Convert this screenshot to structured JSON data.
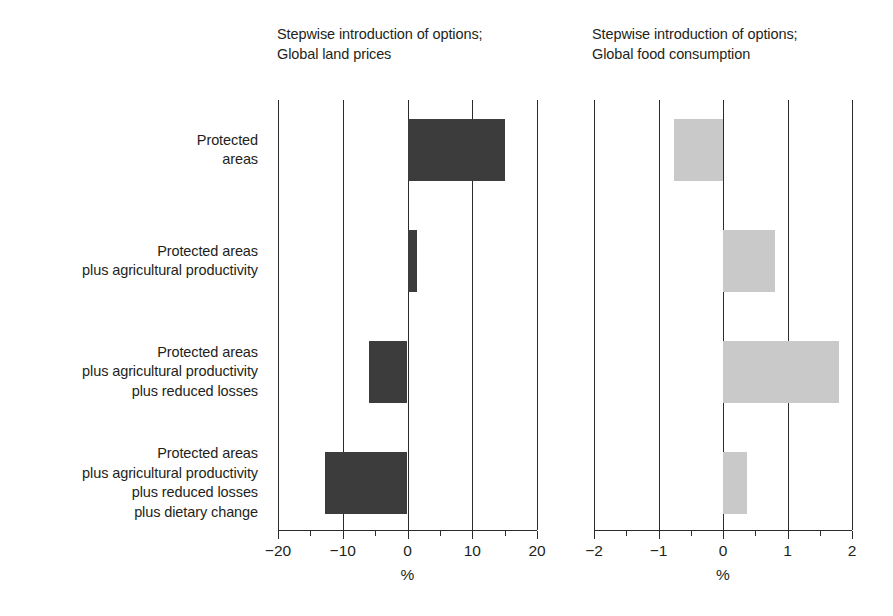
{
  "chart_data": [
    {
      "type": "bar",
      "orientation": "horizontal",
      "title": "Stepwise introduction of options;\nGlobal land prices",
      "title_line1": "Stepwise introduction of options;",
      "title_line2": "Global land prices",
      "xlabel": "%",
      "ylabel": "",
      "xlim": [
        -20,
        20
      ],
      "xticks": [
        -20,
        -10,
        0,
        10,
        20
      ],
      "xtick_labels": [
        "−20",
        "−10",
        "0",
        "10",
        "20"
      ],
      "minor_tick_step": 5,
      "grid": "vertical gridlines at every major tick",
      "legend": "none",
      "bar_color": "#3c3c3c",
      "categories": [
        "Protected\nareas",
        "Protected areas\nplus agricultural productivity",
        "Protected areas\nplus agricultural productivity\nplus reduced losses",
        "Protected areas\nplus agricultural productivity\nplus reduced losses\nplus dietary change"
      ],
      "values": [
        15.0,
        1.5,
        -6.0,
        -12.8
      ]
    },
    {
      "type": "bar",
      "orientation": "horizontal",
      "title": "Stepwise introduction of options;\nGlobal food consumption",
      "title_line1": "Stepwise introduction of options;",
      "title_line2": "Global food consumption",
      "xlabel": "%",
      "ylabel": "",
      "xlim": [
        -2,
        2
      ],
      "xticks": [
        -2,
        -1,
        0,
        1,
        2
      ],
      "xtick_labels": [
        "−2",
        "−1",
        "0",
        "1",
        "2"
      ],
      "minor_tick_step": 0.5,
      "grid": "vertical gridlines at every major tick",
      "legend": "none",
      "bar_color": "#c9c9c9",
      "categories": [
        "Protected\nareas",
        "Protected areas\nplus agricultural productivity",
        "Protected areas\nplus agricultural productivity\nplus reduced losses",
        "Protected areas\nplus agricultural productivity\nplus reduced losses\nplus dietary change"
      ],
      "values": [
        -0.76,
        0.8,
        1.8,
        0.37
      ]
    }
  ],
  "categories": [
    {
      "label": "Protected\nareas"
    },
    {
      "label": "Protected areas\nplus agricultural productivity"
    },
    {
      "label": "Protected areas\nplus agricultural productivity\nplus reduced losses"
    },
    {
      "label": "Protected areas\nplus agricultural productivity\nplus reduced losses\nplus dietary change"
    }
  ],
  "panels": {
    "left": {
      "title": "Stepwise introduction of options;\nGlobal land prices",
      "axis_title": "%",
      "tick_labels": [
        "−20",
        "−10",
        "0",
        "10",
        "20"
      ]
    },
    "right": {
      "title": "Stepwise introduction of options;\nGlobal food consumption",
      "axis_title": "%",
      "tick_labels": [
        "−2",
        "−1",
        "0",
        "1",
        "2"
      ]
    }
  },
  "colors": {
    "bar_dark": "#3c3c3c",
    "bar_light": "#c9c9c9",
    "line": "#2b2b2b",
    "text": "#231f20",
    "background": "#ffffff"
  }
}
